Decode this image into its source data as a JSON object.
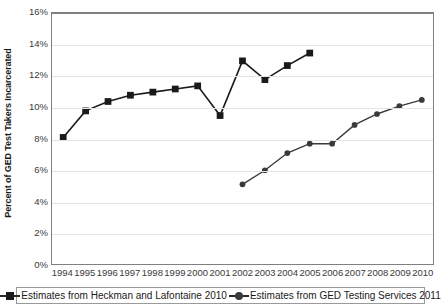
{
  "chart_data": {
    "type": "line",
    "title": "",
    "xlabel": "",
    "ylabel": "Percent of GED Test Takers Incarcerated",
    "x": [
      1994,
      1995,
      1996,
      1997,
      1998,
      1999,
      2000,
      2001,
      2002,
      2003,
      2004,
      2005,
      2006,
      2007,
      2008,
      2009,
      2010
    ],
    "categories": [
      "1994",
      "1995",
      "1996",
      "1997",
      "1998",
      "1999",
      "2000",
      "2001",
      "2002",
      "2003",
      "2004",
      "2005",
      "2006",
      "2007",
      "2008",
      "2009",
      "2010"
    ],
    "ylim": [
      0,
      16
    ],
    "ytick_labels": [
      "0%",
      "2%",
      "4%",
      "6%",
      "8%",
      "10%",
      "12%",
      "14%",
      "16%"
    ],
    "ytick_values": [
      0,
      2,
      4,
      6,
      8,
      10,
      12,
      14,
      16
    ],
    "grid": true,
    "legend_position": "bottom",
    "series": [
      {
        "name": "Estimates from Heckman and Lafontaine 2010",
        "marker": "square",
        "color": "#1a1a1a",
        "x": [
          1994,
          1995,
          1996,
          1997,
          1998,
          1999,
          2000,
          2001,
          2002,
          2003,
          2004,
          2005
        ],
        "values": [
          8.1,
          9.8,
          10.4,
          10.8,
          11.0,
          11.2,
          11.4,
          9.5,
          13.0,
          11.8,
          12.7,
          13.5
        ]
      },
      {
        "name": "Estimates from GED Testing Services 2011",
        "marker": "circle",
        "color": "#3a3a3a",
        "x": [
          2002,
          2003,
          2004,
          2005,
          2006,
          2007,
          2008,
          2009,
          2010
        ],
        "values": [
          5.1,
          6.0,
          7.1,
          7.7,
          7.7,
          8.9,
          9.6,
          10.1,
          10.5
        ]
      }
    ]
  },
  "legend": {
    "entries": [
      {
        "label": "Estimates from Heckman and Lafontaine 2010",
        "marker": "square-marker-icon"
      },
      {
        "label": "Estimates from GED Testing Services 2011",
        "marker": "circle-marker-icon"
      }
    ]
  },
  "colors": {
    "series_one": "#1a1a1a",
    "series_two": "#3a3a3a",
    "gridline": "#e4e4e4",
    "axis": "#808080",
    "background": "#ffffff"
  }
}
